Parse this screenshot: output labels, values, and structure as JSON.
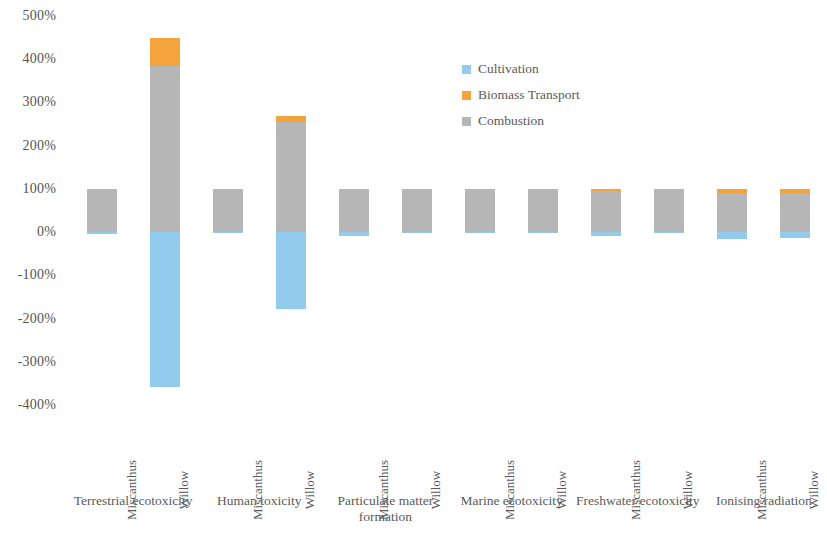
{
  "chart_data": {
    "type": "bar",
    "title": "",
    "subtitle": "",
    "xlabel": "",
    "ylabel": "",
    "stacked": true,
    "grid": false,
    "ylim": [
      -400,
      500
    ],
    "ytick_step": 100,
    "ytick_labels": [
      "500%",
      "400%",
      "300%",
      "200%",
      "100%",
      "0%",
      "-100%",
      "-200%",
      "-300%",
      "-400%"
    ],
    "ytick_values": [
      500,
      400,
      300,
      200,
      100,
      0,
      -100,
      -200,
      -300,
      -400
    ],
    "legend_position": "upper-center",
    "legend": [
      {
        "name": "Cultivation",
        "color": "#93cbee"
      },
      {
        "name": "Biomass Transport",
        "color": "#f5a33c"
      },
      {
        "name": "Combustion",
        "color": "#b6b6b6"
      }
    ],
    "series": [
      {
        "name": "Cultivation",
        "color": "#93cbee",
        "values": [
          -5,
          -359,
          -3,
          -178,
          -8,
          -2,
          -3,
          -2,
          -10,
          -3,
          -17,
          -13
        ]
      },
      {
        "name": "Biomass Transport",
        "color": "#f5a33c",
        "values": [
          0,
          65,
          0,
          13,
          0,
          0,
          0,
          0,
          4,
          0,
          10,
          9
        ]
      },
      {
        "name": "Combustion",
        "color": "#b6b6b6",
        "values": [
          100,
          385,
          100,
          255,
          100,
          100,
          100,
          100,
          96,
          100,
          90,
          91
        ]
      }
    ],
    "categories": [
      {
        "impact": "Terrestrial ecotoxicity",
        "crop": "Miscanthus"
      },
      {
        "impact": "Terrestrial ecotoxicity",
        "crop": "Willow"
      },
      {
        "impact": "Human toxicity",
        "crop": "Miscanthus"
      },
      {
        "impact": "Human toxicity",
        "crop": "Willow"
      },
      {
        "impact": "Particulate matter formation",
        "crop": "Miscanthus"
      },
      {
        "impact": "Particulate matter formation",
        "crop": "Willow"
      },
      {
        "impact": "Marine ecotoxicity",
        "crop": "Miscanthus"
      },
      {
        "impact": "Marine ecotoxicity",
        "crop": "Willow"
      },
      {
        "impact": "Freshwater ecotoxicity",
        "crop": "Miscanthus"
      },
      {
        "impact": "Freshwater ecotoxicity",
        "crop": "Willow"
      },
      {
        "impact": "Ionising radiation",
        "crop": "Miscanthus"
      },
      {
        "impact": "Ionising radiation",
        "crop": "Willow"
      }
    ],
    "crop_labels": [
      "Miscanthus",
      "Willow",
      "Miscanthus",
      "Willow",
      "Miscanthus",
      "Willow",
      "Miscanthus",
      "Willow",
      "Miscanthus",
      "Willow",
      "Miscanthus",
      "Willow"
    ],
    "impact_groups": [
      "Terrestrial ecotoxicity",
      "Human toxicity",
      "Particulate matter formation",
      "Marine ecotoxicity",
      "Freshwater ecotoxicity",
      "Ionising radiation"
    ]
  }
}
